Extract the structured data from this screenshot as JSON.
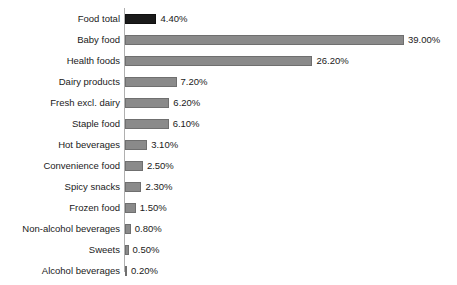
{
  "chart_data": {
    "type": "bar",
    "orientation": "horizontal",
    "title": "",
    "subtitle": "",
    "xlabel": "",
    "ylabel": "",
    "grid": false,
    "legend": null,
    "axis_line": true,
    "xlim": [
      0,
      39
    ],
    "value_suffix": "%",
    "value_format": "0.00%",
    "categories": [
      "Food total",
      "Baby food",
      "Health foods",
      "Dairy products",
      "Fresh excl. dairy",
      "Staple food",
      "Hot beverages",
      "Convenience food",
      "Spicy snacks",
      "Frozen food",
      "Non-alcohol beverages",
      "Sweets",
      "Alcohol beverages"
    ],
    "values": [
      4.4,
      39.0,
      26.2,
      7.2,
      6.2,
      6.1,
      3.1,
      2.5,
      2.3,
      1.5,
      0.8,
      0.5,
      0.2
    ],
    "value_labels": [
      "4.40%",
      "39.00%",
      "26.20%",
      "7.20%",
      "6.20%",
      "6.10%",
      "3.10%",
      "2.50%",
      "2.30%",
      "1.50%",
      "0.80%",
      "0.50%",
      "0.20%"
    ],
    "colors": {
      "bar_default": "#8a8a8a",
      "bar_highlight": "#1a1a1a",
      "bar_border": "#6f6f6f",
      "axis": "#b0b0b0",
      "text": "#1a1a1a",
      "background": "#ffffff"
    },
    "highlight_indices": [
      0
    ]
  }
}
